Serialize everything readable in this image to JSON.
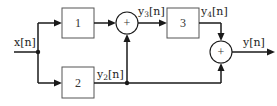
{
  "diagram": {
    "type": "block-diagram",
    "input": {
      "label": "x",
      "arg": "[n]"
    },
    "output": {
      "label": "y",
      "arg": "[n]"
    },
    "blocks": [
      {
        "id": "block-1",
        "label": "1"
      },
      {
        "id": "block-2",
        "label": "2"
      },
      {
        "id": "block-3",
        "label": "3"
      }
    ],
    "summers": [
      {
        "id": "summer-1",
        "symbol": "+"
      },
      {
        "id": "summer-2",
        "symbol": "+"
      }
    ],
    "signals": {
      "y2": {
        "base": "y",
        "sub": "2",
        "arg": "[n]"
      },
      "y3": {
        "base": "y",
        "sub": "3",
        "arg": "[n]"
      },
      "y4": {
        "base": "y",
        "sub": "4",
        "arg": "[n]"
      }
    },
    "connections": [
      "x[n] -> block-1",
      "x[n] -> block-2",
      "block-1 -> summer-1",
      "block-2 (y2[n]) -> summer-1",
      "block-2 (y2[n]) -> summer-2",
      "summer-1 (y3[n]) -> block-3",
      "block-3 (y4[n]) -> summer-2",
      "summer-2 -> y[n]"
    ]
  }
}
